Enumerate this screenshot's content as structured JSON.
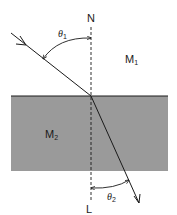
{
  "diagram": {
    "type": "refraction",
    "labels": {
      "normal_top": "N",
      "normal_bottom": "L",
      "medium1": "M",
      "medium1_sub": "1",
      "medium2": "M",
      "medium2_sub": "2",
      "angle1": "θ",
      "angle1_sub": "1",
      "angle2": "θ",
      "angle2_sub": "2"
    },
    "colors": {
      "medium2_fill": "#9a9a9a",
      "line": "#1a1a1a",
      "background": "#ffffff"
    }
  }
}
